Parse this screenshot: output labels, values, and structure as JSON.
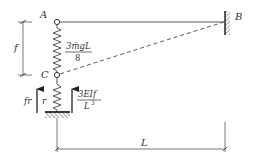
{
  "diagram": {
    "type": "structural-mechanics",
    "nodes": {
      "A": {
        "label": "A"
      },
      "B": {
        "label": "B"
      },
      "C": {
        "label": "C"
      }
    },
    "dimensions": {
      "vertical": {
        "label": "f"
      },
      "horizontal": {
        "label": "L"
      }
    },
    "upper_spring": {
      "force_label_numerator": "3m̄gL",
      "force_label_denominator": "8"
    },
    "lower_spring": {
      "left_arrow_label": "fr",
      "spring_label": "r",
      "right_arrow_numerator": "3EIf",
      "right_arrow_denominator_base": "L",
      "right_arrow_denominator_exp": "3"
    },
    "colors": {
      "line": "#555555",
      "text": "#333333",
      "background": "#ffffff"
    }
  }
}
